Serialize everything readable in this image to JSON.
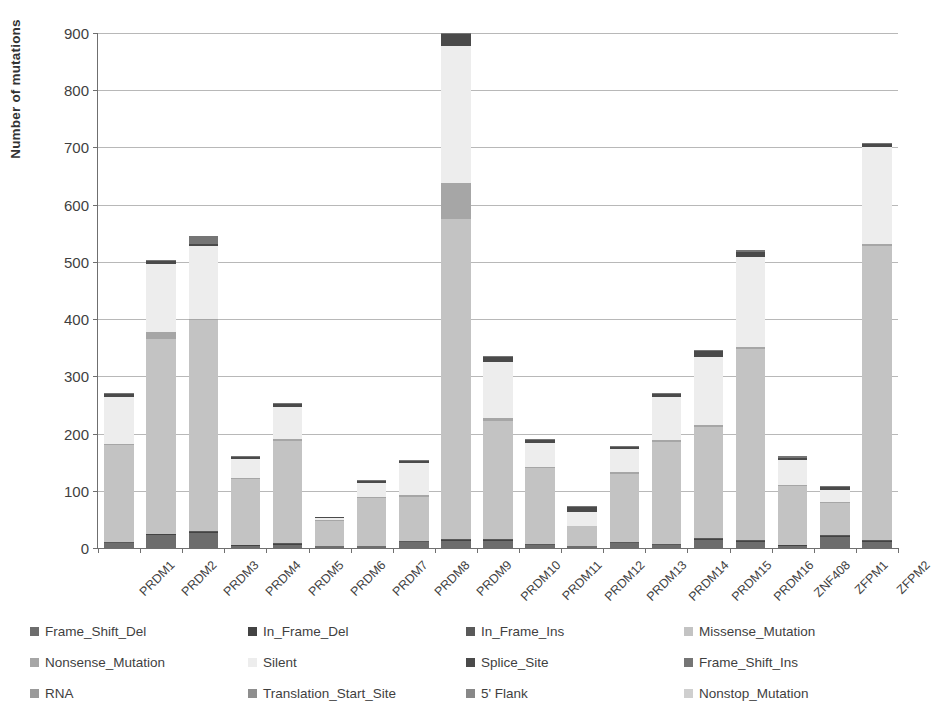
{
  "chart_data": {
    "type": "bar",
    "title": "",
    "subtitle": "",
    "xlabel": "",
    "ylabel": "Number of mutations",
    "ylim": [
      0,
      900
    ],
    "yticks": [
      0,
      100,
      200,
      300,
      400,
      500,
      600,
      700,
      800,
      900
    ],
    "grid": true,
    "stacked": true,
    "legend_position": "bottom",
    "legend_columns": 4,
    "categories": [
      "PRDM1",
      "PRDM2",
      "PRDM3",
      "PRDM4",
      "PRDM5",
      "PRDM6",
      "PRDM7",
      "PRDM8",
      "PRDM9",
      "PRDM10",
      "PRDM11",
      "PRDM12",
      "PRDM13",
      "PRDM14",
      "PRDM15",
      "PRDM16",
      "ZNF408",
      "ZFPM1",
      "ZFPM2"
    ],
    "series": [
      {
        "name": "Frame_Shift_Del",
        "color": "#6d6d6d",
        "values": [
          8,
          22,
          26,
          4,
          6,
          4,
          3,
          10,
          12,
          12,
          5,
          3,
          8,
          5,
          14,
          11,
          4,
          20,
          11
        ]
      },
      {
        "name": "In_Frame_Del",
        "color": "#434343",
        "values": [
          1,
          2,
          2,
          1,
          1,
          0,
          1,
          1,
          2,
          2,
          1,
          0,
          1,
          1,
          2,
          2,
          1,
          1,
          2
        ]
      },
      {
        "name": "In_Frame_Ins",
        "color": "#595959",
        "values": [
          1,
          1,
          1,
          0,
          1,
          0,
          0,
          1,
          1,
          1,
          1,
          0,
          1,
          1,
          1,
          1,
          0,
          1,
          1
        ]
      },
      {
        "name": "Missense_Mutation",
        "color": "#c3c3c3",
        "values": [
          170,
          340,
          369,
          115,
          179,
          44,
          84,
          78,
          560,
          207,
          133,
          35,
          120,
          178,
          195,
          334,
          103,
          56,
          513
        ]
      },
      {
        "name": "Nonsense_Mutation",
        "color": "#a6a6a6",
        "values": [
          2,
          13,
          2,
          2,
          4,
          1,
          2,
          2,
          63,
          5,
          2,
          1,
          2,
          3,
          3,
          4,
          2,
          2,
          4
        ]
      },
      {
        "name": "Silent",
        "color": "#ededed",
        "values": [
          82,
          119,
          128,
          34,
          56,
          3,
          24,
          56,
          240,
          98,
          41,
          24,
          41,
          76,
          118,
          157,
          43,
          21,
          169
        ]
      },
      {
        "name": "Splice_Site",
        "color": "#4a4a4a",
        "values": [
          5,
          5,
          4,
          3,
          4,
          1,
          3,
          4,
          20,
          9,
          5,
          9,
          4,
          5,
          11,
          9,
          5,
          5,
          6
        ]
      },
      {
        "name": "Frame_Shift_Ins",
        "color": "#757575",
        "values": [
          1,
          1,
          14,
          1,
          1,
          0,
          1,
          1,
          2,
          1,
          1,
          1,
          1,
          1,
          2,
          1,
          1,
          1,
          1
        ]
      },
      {
        "name": "RNA",
        "color": "#9a9a9a",
        "values": [
          0,
          0,
          0,
          0,
          0,
          0,
          0,
          0,
          0,
          0,
          0,
          0,
          0,
          0,
          0,
          0,
          0,
          0,
          0
        ]
      },
      {
        "name": "Translation_Start_Site",
        "color": "#8e8e8e",
        "values": [
          0,
          0,
          0,
          0,
          0,
          0,
          0,
          0,
          0,
          0,
          0,
          0,
          0,
          0,
          0,
          0,
          0,
          0,
          0
        ]
      },
      {
        "name": "5' Flank",
        "color": "#888888",
        "values": [
          0,
          0,
          0,
          0,
          0,
          0,
          0,
          0,
          0,
          0,
          0,
          0,
          0,
          0,
          0,
          0,
          0,
          0,
          0
        ]
      },
      {
        "name": "Nonstop_Mutation",
        "color": "#cfcfcf",
        "values": [
          0,
          0,
          0,
          0,
          0,
          0,
          0,
          0,
          0,
          0,
          0,
          0,
          0,
          0,
          0,
          0,
          0,
          0,
          0
        ]
      }
    ],
    "totals": [
      270,
      503,
      546,
      160,
      252,
      53,
      118,
      153,
      900,
      335,
      189,
      73,
      178,
      270,
      346,
      519,
      159,
      107,
      707
    ]
  },
  "legend": {
    "items": [
      {
        "label": "Frame_Shift_Del",
        "color": "#6d6d6d"
      },
      {
        "label": "In_Frame_Del",
        "color": "#434343"
      },
      {
        "label": "In_Frame_Ins",
        "color": "#595959"
      },
      {
        "label": "Missense_Mutation",
        "color": "#c3c3c3"
      },
      {
        "label": "Nonsense_Mutation",
        "color": "#a6a6a6"
      },
      {
        "label": "Silent",
        "color": "#ededed"
      },
      {
        "label": "Splice_Site",
        "color": "#4a4a4a"
      },
      {
        "label": "Frame_Shift_Ins",
        "color": "#757575"
      },
      {
        "label": "RNA",
        "color": "#9a9a9a"
      },
      {
        "label": "Translation_Start_Site",
        "color": "#8e8e8e"
      },
      {
        "label": "5' Flank",
        "color": "#888888"
      },
      {
        "label": "Nonstop_Mutation",
        "color": "#cfcfcf"
      }
    ]
  },
  "axes": {
    "y_title": "Number of mutations",
    "y_tick_labels": [
      "0",
      "100",
      "200",
      "300",
      "400",
      "500",
      "600",
      "700",
      "800",
      "900"
    ],
    "x_tick_labels": [
      "PRDM1",
      "PRDM2",
      "PRDM3",
      "PRDM4",
      "PRDM5",
      "PRDM6",
      "PRDM7",
      "PRDM8",
      "PRDM9",
      "PRDM10",
      "PRDM11",
      "PRDM12",
      "PRDM13",
      "PRDM14",
      "PRDM15",
      "PRDM16",
      "ZNF408",
      "ZFPM1",
      "ZFPM2"
    ]
  }
}
